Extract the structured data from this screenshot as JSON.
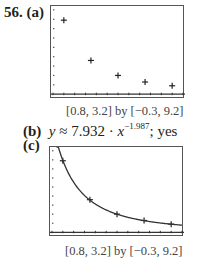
{
  "problem": {
    "number": "56.",
    "parts": {
      "a": {
        "label": "(a)"
      },
      "b": {
        "label": "(b)",
        "prefix": "y",
        "approx": "≈",
        "coef": "7.932",
        "dot": "·",
        "var": "x",
        "exponent": "−1.987",
        "suffix": "; yes"
      },
      "c": {
        "label": "(c)"
      }
    },
    "window_caption": "[0.8, 3.2] by [−0.3, 9.2]"
  },
  "chart_data": [
    {
      "type": "scatter",
      "title": "(a)",
      "xlabel": "",
      "ylabel": "",
      "xlim": [
        0.8,
        3.2
      ],
      "ylim": [
        -0.3,
        9.2
      ],
      "x_tick_step": 0.2,
      "y_tick_step": 1,
      "grid": false,
      "caption": "[0.8, 3.2] by [−0.3, 9.2]",
      "series": [
        {
          "name": "data",
          "marker": "+",
          "x": [
            1.0,
            1.5,
            2.0,
            2.5,
            3.0
          ],
          "y": [
            7.9,
            3.6,
            2.0,
            1.3,
            0.9
          ]
        }
      ]
    },
    {
      "type": "line",
      "title": "(c)",
      "xlabel": "",
      "ylabel": "",
      "xlim": [
        0.8,
        3.2
      ],
      "ylim": [
        -0.3,
        9.2
      ],
      "x_tick_step": 0.2,
      "y_tick_step": 1,
      "grid": false,
      "caption": "[0.8, 3.2] by [−0.3, 9.2]",
      "series": [
        {
          "name": "data",
          "marker": "+",
          "x": [
            1.0,
            1.5,
            2.0,
            2.5,
            3.0
          ],
          "y": [
            7.9,
            3.6,
            2.0,
            1.3,
            0.9
          ]
        },
        {
          "name": "fit",
          "formula": "y = 7.932 · x^(−1.987)",
          "a": 7.932,
          "b": -1.987
        }
      ]
    }
  ]
}
